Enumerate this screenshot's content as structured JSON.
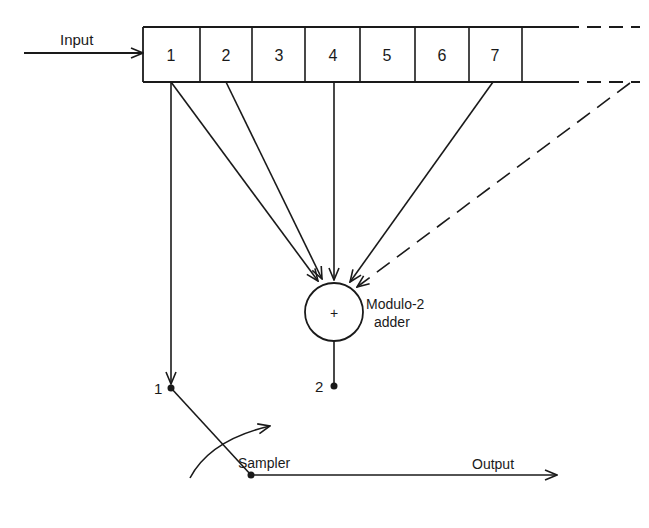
{
  "diagram": {
    "input_label": "Input",
    "output_label": "Output",
    "register_cells": [
      "1",
      "2",
      "3",
      "4",
      "5",
      "6",
      "7"
    ],
    "adder_symbol": "+",
    "adder_label_line1": "Modulo-2",
    "adder_label_line2": "adder",
    "sampler_label": "Sampler",
    "switch_terminal_1": "1",
    "switch_terminal_2": "2",
    "taps": [
      "1",
      "2",
      "4",
      "7",
      "..."
    ],
    "colors": {
      "line": "#1a1a1a",
      "background": "#ffffff"
    }
  }
}
